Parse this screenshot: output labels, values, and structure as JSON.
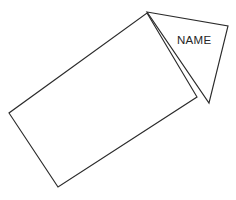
{
  "canvas": {
    "width": 236,
    "height": 200,
    "background_color": "#ffffff"
  },
  "style": {
    "stroke_color": "#2b2b2b",
    "stroke_width": 1.15,
    "fill_color": "#ffffff",
    "label_color": "#262626",
    "label_font_size": 11.5
  },
  "shapes": {
    "rectangle": {
      "name": "rotated-rectangle",
      "points": "147,13 197,97 58,187 9,113"
    },
    "triangle": {
      "name": "triangle-flag",
      "points": "147,12 228,26 209,103"
    }
  },
  "labels": {
    "name_label": {
      "text": "NAME",
      "x": 177,
      "y": 44
    }
  }
}
